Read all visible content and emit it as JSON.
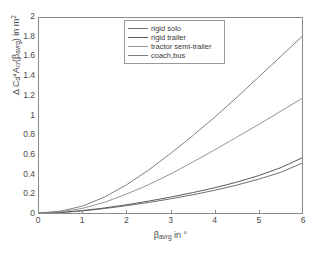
{
  "chart_data": {
    "type": "line",
    "title": "",
    "xlabel": "β_avrg in °",
    "ylabel": "Δ C_d*A_cr(β_avrg) in m²",
    "xlabel_parts": {
      "symbol": "β",
      "subscript": "avrg",
      "suffix": "in °"
    },
    "ylabel_parts": {
      "delta": "Δ",
      "c": "C",
      "c_sub": "d",
      "star": "*",
      "a": "A",
      "a_sub": "cr",
      "open": "(",
      "beta": "β",
      "beta_sub": "avrg",
      "close": ")",
      "suffix": "in m",
      "suffix_sup": "2"
    },
    "xlim": [
      0,
      6
    ],
    "ylim": [
      0,
      2
    ],
    "xticks": [
      "0",
      "1",
      "2",
      "3",
      "4",
      "5",
      "6"
    ],
    "yticks": [
      "0",
      "0.2",
      "0.4",
      "0.6",
      "0.8",
      "1",
      "1.2",
      "1.4",
      "1.6",
      "1.8",
      "2"
    ],
    "grid": false,
    "legend_position": "top-center",
    "x": [
      0,
      0.5,
      1,
      1.5,
      2,
      2.5,
      3,
      3.5,
      4,
      4.5,
      5,
      5.5,
      6
    ],
    "series": [
      {
        "name": "rigid solo",
        "color": "#6e6e6e",
        "values": [
          0,
          0.005,
          0.022,
          0.046,
          0.075,
          0.108,
          0.145,
          0.186,
          0.232,
          0.285,
          0.345,
          0.415,
          0.51
        ]
      },
      {
        "name": "rigid trailer",
        "color": "#5a5a5a",
        "values": [
          0,
          0.006,
          0.025,
          0.052,
          0.085,
          0.122,
          0.163,
          0.208,
          0.258,
          0.315,
          0.382,
          0.462,
          0.565
        ]
      },
      {
        "name": "tractor semi-trailer",
        "color": "#949494",
        "values": [
          0,
          0.012,
          0.048,
          0.11,
          0.195,
          0.29,
          0.4,
          0.52,
          0.645,
          0.775,
          0.905,
          1.04,
          1.175
        ]
      },
      {
        "name": "coach,bus",
        "color": "#7d7d7d",
        "values": [
          0,
          0.02,
          0.072,
          0.165,
          0.29,
          0.44,
          0.61,
          0.79,
          0.98,
          1.18,
          1.39,
          1.6,
          1.81
        ]
      }
    ],
    "legend_entries": [
      "rigid solo",
      "rigid trailer",
      "tractor semi-trailer",
      "coach,bus"
    ],
    "axis_color": "#8a8a8a",
    "text_color": "#4a4a4a"
  }
}
